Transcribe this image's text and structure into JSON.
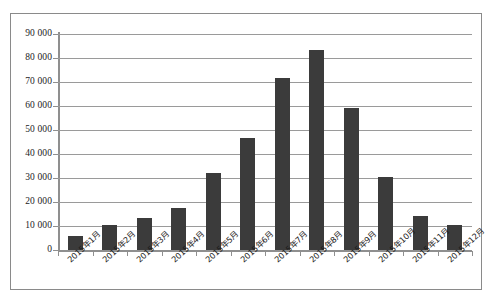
{
  "chart_data": {
    "type": "bar",
    "title": "",
    "subtitle": "",
    "xlabel": "",
    "ylabel": "",
    "categories": [
      "2015年1月",
      "2015年2月",
      "2015年3月",
      "2015年4月",
      "2015年5月",
      "2015年6月",
      "2015年7月",
      "2015年8月",
      "2015年9月",
      "2015年10月",
      "2015年11月",
      "2015年12月"
    ],
    "values": [
      6000,
      10500,
      13500,
      17500,
      32000,
      46500,
      71500,
      83500,
      59000,
      30500,
      14000,
      10500
    ],
    "ylim": [
      0,
      90000
    ],
    "ytick_values": [
      0,
      10000,
      20000,
      30000,
      40000,
      50000,
      60000,
      70000,
      80000,
      90000
    ],
    "ytick_labels": [
      "0",
      "10 000",
      "20 000",
      "30 000",
      "40 000",
      "50 000",
      "60 000",
      "70 000",
      "80 000",
      "90 000"
    ],
    "grid": true,
    "grid_axis": "y",
    "legend": false,
    "legend_position": "none",
    "series": [
      {
        "name": "",
        "color": "#3b3b3b",
        "values": [
          6000,
          10500,
          13500,
          17500,
          32000,
          46500,
          71500,
          83500,
          59000,
          30500,
          14000,
          10500
        ]
      }
    ]
  },
  "colors": {
    "bar": "#3b3b3b",
    "gridline": "#9a9a9a",
    "axis": "#8f8f8f",
    "frame": "#8a8a8a",
    "text": "#1c1c1c",
    "background": "#ffffff"
  }
}
